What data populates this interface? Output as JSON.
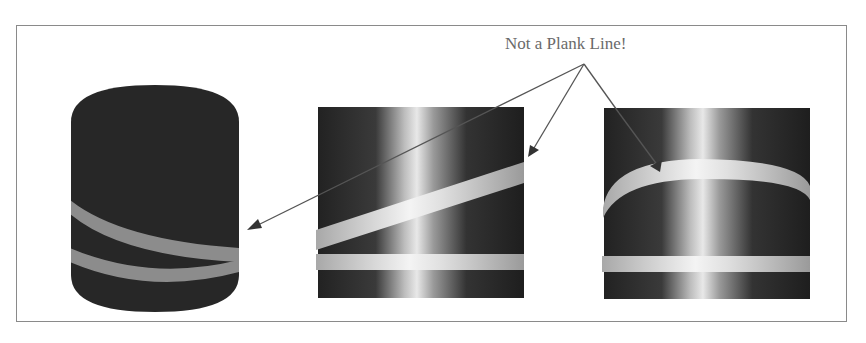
{
  "diagram": {
    "callout_label": "Not a Plank Line!",
    "colors": {
      "cylinder_dark": "#262626",
      "band_light": "#d8d8d8",
      "band_gray": "#8c8c8c",
      "arrow": "#555555",
      "frame": "#8a8a8a"
    },
    "panels": [
      {
        "name": "3d-cylinder",
        "description": "dark cylinder with one spiral and one horizontal band"
      },
      {
        "name": "unrolled-surface-spiral",
        "description": "unrolled cylinder surface with diagonal spiral band and horizontal band"
      },
      {
        "name": "unrolled-surface-curved",
        "description": "unrolled cylinder surface with curved arc band and horizontal band"
      }
    ]
  }
}
